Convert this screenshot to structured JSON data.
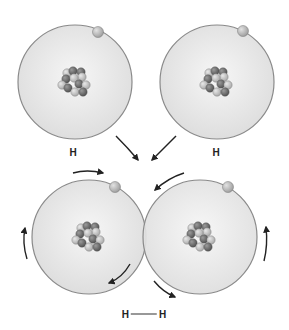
{
  "colors": {
    "orbit_stroke": "#8a8a8a",
    "atom_fill_center": "#f4f4f4",
    "atom_fill_edge": "#dcdcdc",
    "electron": "#bdbdbd",
    "proton": "#6f6f6f",
    "neutron": "#c4c4c4",
    "arrow": "#222222"
  },
  "atoms": [
    {
      "id": "top-left",
      "label": "H",
      "cx": 75,
      "cy": 82,
      "r": 57,
      "electron": [
        98,
        32
      ]
    },
    {
      "id": "top-right",
      "label": "H",
      "cx": 217,
      "cy": 82,
      "r": 57,
      "electron": [
        243,
        31
      ]
    },
    {
      "id": "bottom-left",
      "label": "",
      "cx": 89,
      "cy": 237,
      "r": 57,
      "electron": [
        115,
        187
      ]
    },
    {
      "id": "bottom-right",
      "label": "",
      "cx": 200,
      "cy": 237,
      "r": 57,
      "electron": [
        228,
        187
      ]
    }
  ],
  "labels": {
    "atom_1": "H",
    "atom_2": "H",
    "molecule_left": "H",
    "molecule_right": "H"
  },
  "arrows": [
    {
      "name": "combine-arrow-left",
      "description": "points down-right toward center"
    },
    {
      "name": "combine-arrow-right",
      "description": "points down-left toward center"
    },
    {
      "name": "orbit-arrow-top-left",
      "description": "clockwise along top of bottom-left atom"
    },
    {
      "name": "orbit-arrow-left",
      "description": "upward on left side of bottom-left atom"
    },
    {
      "name": "orbit-arrow-bottom-left",
      "description": "down-left at lower right of bottom-left atom"
    },
    {
      "name": "orbit-arrow-top-right",
      "description": "counter-clockwise along top of bottom-right atom"
    },
    {
      "name": "orbit-arrow-right",
      "description": "upward on right side of bottom-right atom"
    },
    {
      "name": "orbit-arrow-bottom-right",
      "description": "down-right at lower left of bottom-right atom"
    }
  ]
}
